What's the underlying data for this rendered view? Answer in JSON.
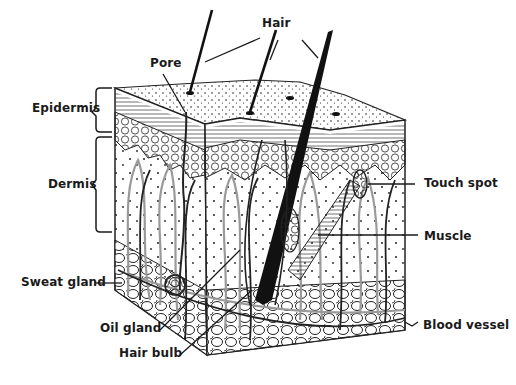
{
  "diagram": {
    "ink_color": "#1a1a1a",
    "gray_color": "#9a9a9a",
    "background": "#ffffff",
    "labels": {
      "hair": "Hair",
      "pore": "Pore",
      "epidermis": "Epidermis",
      "dermis": "Dermis",
      "touch_spot": "Touch spot",
      "muscle": "Muscle",
      "sweat_gland": "Sweat gland",
      "oil_gland": "Oil gland",
      "hair_bulb": "Hair bulb",
      "blood_vessel": "Blood vessel"
    }
  }
}
